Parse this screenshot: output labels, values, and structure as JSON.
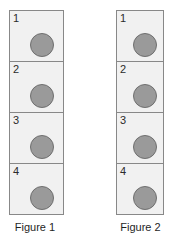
{
  "canvas": {
    "width": 173,
    "height": 243,
    "background": "#ffffff"
  },
  "style": {
    "cell_fill": "#f1f1f1",
    "cell_border": "#888888",
    "dot_fill": "#9a9a9a",
    "dot_border": "#6f6f6f",
    "text_color": "#2b2b2b"
  },
  "figures": [
    {
      "id": "figure-1",
      "caption": "Figure 1",
      "cells": [
        {
          "number": "1",
          "shape": "circle"
        },
        {
          "number": "2",
          "shape": "circle"
        },
        {
          "number": "3",
          "shape": "circle"
        },
        {
          "number": "4",
          "shape": "circle"
        }
      ]
    },
    {
      "id": "figure-2",
      "caption": "Figure 2",
      "cells": [
        {
          "number": "1",
          "shape": "circle"
        },
        {
          "number": "2",
          "shape": "circle"
        },
        {
          "number": "3",
          "shape": "circle"
        },
        {
          "number": "4",
          "shape": "circle"
        }
      ]
    }
  ]
}
